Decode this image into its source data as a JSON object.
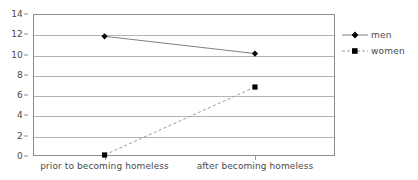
{
  "chart_data": {
    "type": "line",
    "title": "",
    "subtitle": "",
    "xlabel": "",
    "ylabel": "",
    "categories": [
      "prior to becoming homeless",
      "after becoming homeless"
    ],
    "series": [
      {
        "name": "men",
        "values": [
          11.8,
          10.1
        ],
        "line_style": "solid",
        "marker": "diamond",
        "line_color": "#808080",
        "marker_color": "#000000"
      },
      {
        "name": "women",
        "values": [
          0.1,
          6.8
        ],
        "line_style": "dashed",
        "marker": "square",
        "line_color": "#9a9a9a",
        "marker_color": "#000000"
      }
    ],
    "ylim": [
      0,
      14
    ],
    "y_ticks": [
      0,
      2,
      4,
      6,
      8,
      10,
      12,
      14
    ],
    "y_tick_labels": [
      "0",
      "2",
      "4",
      "6",
      "8",
      "10",
      "12",
      "14"
    ],
    "grid": true,
    "grid_axis": "y",
    "grid_color": "#b4b4b4",
    "legend": {
      "position": "right",
      "entries": [
        "men",
        "women"
      ]
    },
    "plot_border_color": "#8e8e8e",
    "background_color": "#ffffff"
  }
}
